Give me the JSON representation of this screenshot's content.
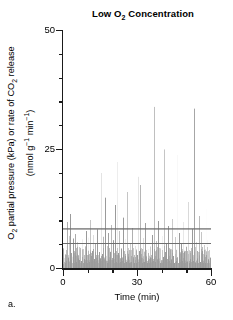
{
  "panel": {
    "label": "a."
  },
  "chart_data": {
    "type": "bar",
    "title": "Low O2 Concentration",
    "title_parts": {
      "pre": "Low O",
      "sub": "2",
      "post": " Concentration"
    },
    "xlabel": "Time (min)",
    "ylabel_line1_parts": {
      "a": "O",
      "a_sub": "2",
      "b": " partial pressure (kPa) or rate of CO",
      "b_sub": "2",
      "c": " release"
    },
    "ylabel_line2_parts": {
      "a": "(nmol g",
      "a_sup": "−1",
      "b": " min",
      "b_sup": "−1",
      "c": ")"
    },
    "ylabel": "O2 partial pressure (kPa) or rate of CO2 release (nmol g-1 min-1)",
    "xlim": [
      0,
      60
    ],
    "ylim": [
      0,
      50
    ],
    "xticks_major": [
      0,
      30,
      60
    ],
    "xticks_major_labels": [
      "0",
      "30",
      "60"
    ],
    "xticks_minor": [
      10,
      20,
      40,
      50
    ],
    "yticks_major": [
      0,
      25,
      50
    ],
    "yticks_major_labels": [
      "0",
      "25",
      "50"
    ],
    "yticks_minor": [
      5,
      10,
      15,
      20,
      30,
      35,
      40,
      45
    ],
    "grid": false,
    "legend": null,
    "series_color": "#9a9a9a",
    "axis_color": "#1a1a1a",
    "reference_line_color": "#6f6f6f",
    "reference_lines": [
      {
        "name": "upper-reference-line",
        "value": 8.2
      },
      {
        "name": "lower-reference-line",
        "value": 5.2
      }
    ],
    "bar_width_min": 0.22,
    "x": [
      0.25,
      0.5,
      0.75,
      1.0,
      1.25,
      1.5,
      1.75,
      2.0,
      2.25,
      2.5,
      2.75,
      3.0,
      3.25,
      3.5,
      3.75,
      4.0,
      4.25,
      4.5,
      4.75,
      5.0,
      5.25,
      5.5,
      5.75,
      6.0,
      6.25,
      6.5,
      6.75,
      7.0,
      7.25,
      7.5,
      7.75,
      8.0,
      8.25,
      8.5,
      8.75,
      9.0,
      9.25,
      9.5,
      9.75,
      10.0,
      10.25,
      10.5,
      10.75,
      11.0,
      11.25,
      11.5,
      11.75,
      12.0,
      12.25,
      12.5,
      12.75,
      13.0,
      13.25,
      13.5,
      13.75,
      14.0,
      14.25,
      14.5,
      14.75,
      15.0,
      15.25,
      15.5,
      15.75,
      16.0,
      16.25,
      16.5,
      16.75,
      17.0,
      17.25,
      17.5,
      17.75,
      18.0,
      18.25,
      18.5,
      18.75,
      19.0,
      19.25,
      19.5,
      19.75,
      20.0,
      20.25,
      20.5,
      20.75,
      21.0,
      21.25,
      21.5,
      21.75,
      22.0,
      22.25,
      22.5,
      22.75,
      23.0,
      23.25,
      23.5,
      23.75,
      24.0,
      24.25,
      24.5,
      24.75,
      25.0,
      25.25,
      25.5,
      25.75,
      26.0,
      26.25,
      26.5,
      26.75,
      27.0,
      27.25,
      27.5,
      27.75,
      28.0,
      28.25,
      28.5,
      28.75,
      29.0,
      29.25,
      29.5,
      29.75,
      30.0,
      30.25,
      30.5,
      30.75,
      31.0,
      31.25,
      31.5,
      31.75,
      32.0,
      32.25,
      32.5,
      32.75,
      33.0,
      33.25,
      33.5,
      33.75,
      34.0,
      34.25,
      34.5,
      34.75,
      35.0,
      35.25,
      35.5,
      35.75,
      36.0,
      36.25,
      36.5,
      36.75,
      37.0,
      37.25,
      37.5,
      37.75,
      38.0,
      38.25,
      38.5,
      38.75,
      39.0,
      39.25,
      39.5,
      39.75,
      40.0,
      40.25,
      40.5,
      40.75,
      41.0,
      41.25,
      41.5,
      41.75,
      42.0,
      42.25,
      42.5,
      42.75,
      43.0,
      43.25,
      43.5,
      43.75,
      44.0,
      44.25,
      44.5,
      44.75,
      45.0,
      45.25,
      45.5,
      45.75,
      46.0,
      46.25,
      46.5,
      46.75,
      47.0,
      47.25,
      47.5,
      47.75,
      48.0,
      48.25,
      48.5,
      48.75,
      49.0,
      49.25,
      49.5,
      49.75,
      50.0,
      50.25,
      50.5,
      50.75,
      51.0,
      51.25,
      51.5,
      51.75,
      52.0,
      52.25,
      52.5,
      52.75,
      53.0,
      53.25,
      53.5,
      53.75,
      54.0,
      54.25,
      54.5,
      54.75,
      55.0,
      55.25,
      55.5,
      55.75,
      56.0,
      56.25,
      56.5,
      56.75,
      57.0,
      57.25,
      57.5,
      57.75,
      58.0,
      58.25,
      58.5,
      58.75,
      59.0,
      59.25,
      59.5,
      59.75,
      60.0
    ],
    "values": [
      0.8,
      1.2,
      2.1,
      1.0,
      4.6,
      1.5,
      9.7,
      12.6,
      2.2,
      1.4,
      6.8,
      11.4,
      1.8,
      3.1,
      1.1,
      2.4,
      6.2,
      1.6,
      1.0,
      7.1,
      4.2,
      1.3,
      0.9,
      5.5,
      2.0,
      8.6,
      1.7,
      1.1,
      3.8,
      1.4,
      6.0,
      2.3,
      1.0,
      9.2,
      1.9,
      1.2,
      4.4,
      7.7,
      1.5,
      1.0,
      2.8,
      6.4,
      1.3,
      1.8,
      10.1,
      2.5,
      1.1,
      3.6,
      1.4,
      6.9,
      1.9,
      1.0,
      5.1,
      2.2,
      1.3,
      8.1,
      1.6,
      1.0,
      3.3,
      12.9,
      2.0,
      1.4,
      19.9,
      3.0,
      1.2,
      6.6,
      1.8,
      1.1,
      14.8,
      2.6,
      1.5,
      1.0,
      4.9,
      7.3,
      1.7,
      1.2,
      3.4,
      1.0,
      9.0,
      2.1,
      1.4,
      5.8,
      1.1,
      1.9,
      13.2,
      2.7,
      1.3,
      1.0,
      22.2,
      3.2,
      1.6,
      7.8,
      1.2,
      1.0,
      4.1,
      2.3,
      1.5,
      10.6,
      1.8,
      1.1,
      2.9,
      6.1,
      1.3,
      1.0,
      16.0,
      2.4,
      1.7,
      1.1,
      5.3,
      3.7,
      1.2,
      1.0,
      8.4,
      2.0,
      1.4,
      1.0,
      4.7,
      1.6,
      1.1,
      12.1,
      2.8,
      1.3,
      19.2,
      3.5,
      1.0,
      17.5,
      2.2,
      1.5,
      1.1,
      6.3,
      1.9,
      1.2,
      1.0,
      9.4,
      2.6,
      1.4,
      1.0,
      4.0,
      1.7,
      1.1,
      11.7,
      2.1,
      1.3,
      1.0,
      7.0,
      3.1,
      1.5,
      33.9,
      2.4,
      1.2,
      1.0,
      5.6,
      1.8,
      1.1,
      9.9,
      2.0,
      1.4,
      1.0,
      3.9,
      1.6,
      1.1,
      6.7,
      2.3,
      1.3,
      24.9,
      3.4,
      1.0,
      5.0,
      1.9,
      1.2,
      8.8,
      2.1,
      1.5,
      1.0,
      4.3,
      1.7,
      1.1,
      10.3,
      2.5,
      1.3,
      1.0,
      6.5,
      3.0,
      1.4,
      23.8,
      2.2,
      1.1,
      1.0,
      7.4,
      1.8,
      1.2,
      5.2,
      2.7,
      1.5,
      1.0,
      9.6,
      3.3,
      1.1,
      1.0,
      4.5,
      1.6,
      1.3,
      13.9,
      2.9,
      1.0,
      6.0,
      1.9,
      1.2,
      1.0,
      8.2,
      2.4,
      1.4,
      33.5,
      3.2,
      1.1,
      1.0,
      5.4,
      2.0,
      1.5,
      1.0,
      10.9,
      2.6,
      1.2,
      1.0,
      7.6,
      3.6,
      1.7,
      1.0,
      4.8,
      1.3,
      1.1,
      12.4,
      2.8,
      1.0,
      5.9,
      1.8,
      1.4,
      1.0,
      2.2,
      1.0
    ]
  }
}
